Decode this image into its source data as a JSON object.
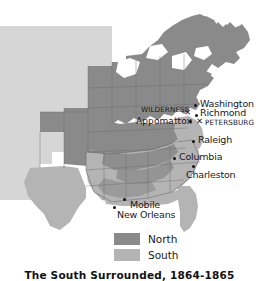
{
  "caption": "The South Surrounded, 1864-1865",
  "colors": {
    "north": "#8a8a8a",
    "south": "#b4b4b4",
    "territory": "#d6d6d6",
    "background": "#ffffff",
    "border": "#6e6e6e",
    "marker": "#111111",
    "text": "#1a1a1a"
  },
  "legend": {
    "items": [
      {
        "label": "North",
        "color": "#8a8a8a",
        "swatch_name": "north-swatch"
      },
      {
        "label": "South",
        "color": "#b4b4b4",
        "swatch_name": "south-swatch"
      }
    ]
  },
  "map": {
    "cities": [
      {
        "name": "Washington",
        "label_x": 202,
        "label_y": 104,
        "dot_x": 195,
        "dot_y": 106
      },
      {
        "name": "Richmond",
        "label_x": 202,
        "label_y": 113,
        "dot_x": 196,
        "dot_y": 117
      },
      {
        "name": "Raleigh",
        "label_x": 199,
        "label_y": 141,
        "dot_x": 193,
        "dot_y": 143
      },
      {
        "name": "Columbia",
        "label_x": 180,
        "label_y": 158,
        "dot_x": 174,
        "dot_y": 160
      },
      {
        "name": "Charleston",
        "label_x": 189,
        "label_y": 172,
        "dot_x": 193,
        "dot_y": 167
      },
      {
        "name": "Mobile",
        "label_x": 130,
        "label_y": 204,
        "dot_x": 124,
        "dot_y": 200
      },
      {
        "name": "New Orleans",
        "label_x": 118,
        "label_y": 214,
        "dot_x": 114,
        "dot_y": 207
      }
    ],
    "battles": [
      {
        "name": "WILDERNESS",
        "label_x": 141,
        "label_y": 109,
        "x_x": 184,
        "x_y": 112
      },
      {
        "name": "Appomattox",
        "label_x": 138,
        "label_y": 121,
        "dot_x": 189,
        "dot_y": 122
      },
      {
        "name": "PETERSBURG",
        "label_x": 207,
        "label_y": 123,
        "x_x": 198,
        "x_y": 121
      }
    ]
  }
}
